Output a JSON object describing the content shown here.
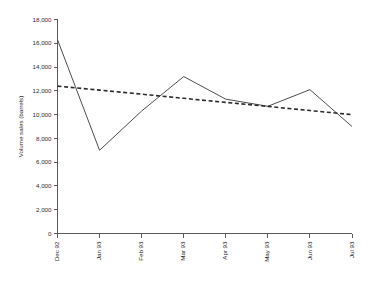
{
  "chart_data": {
    "type": "line",
    "title": "",
    "xlabel": "",
    "ylabel": "Volume sales (barrels)",
    "categories": [
      "Dec 92",
      "Jan 93",
      "Feb 93",
      "Mar 93",
      "Apr 93",
      "May 93",
      "Jun 93",
      "Jul 93"
    ],
    "ylim": [
      0,
      18000
    ],
    "ytick_labels": [
      "18,000",
      "16,000",
      "14,000",
      "12,000",
      "10,000",
      "8,000",
      "6,000",
      "4,000",
      "2,000",
      "0"
    ],
    "ytick_values": [
      18000,
      16000,
      14000,
      12000,
      10000,
      8000,
      6000,
      4000,
      2000,
      0
    ],
    "grid": false,
    "legend": "none",
    "series": [
      {
        "name": "Volume sales",
        "style": "solid",
        "color": "#4d4d4d",
        "values": [
          16300,
          7000,
          10300,
          13200,
          11300,
          10700,
          12100,
          9000
        ]
      },
      {
        "name": "Linear trend",
        "style": "dashed",
        "color": "#2b2b2b",
        "values": [
          12400,
          12060,
          11720,
          11370,
          11030,
          10690,
          10340,
          10000
        ]
      }
    ]
  }
}
